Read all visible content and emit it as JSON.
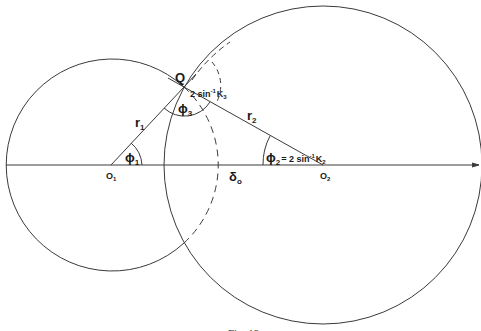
{
  "figure": {
    "caption": "Fig. 13",
    "colors": {
      "line": "#3a3a3a",
      "background": "#ffffff"
    },
    "points": {
      "Q": {
        "label": "Q"
      },
      "O1": {
        "label": "O",
        "sub": "1"
      },
      "O2": {
        "label": "O",
        "sub": "2"
      }
    },
    "segments": {
      "r1": {
        "label": "r",
        "sub": "1"
      },
      "r2": {
        "label": "r",
        "sub": "2"
      },
      "delta0": {
        "label": "δ",
        "sub": "o"
      }
    },
    "angles": {
      "phi1": {
        "label": "ϕ",
        "sub": "1"
      },
      "phi2": {
        "label": "ϕ",
        "sub": "2",
        "eq": "= 2 sin",
        "sup": "-1",
        "k": "K",
        "ksub": "2"
      },
      "phi3": {
        "label": "ϕ",
        "sub": "3"
      },
      "k3": {
        "text": "2 sin",
        "sup": "-1",
        "k": "K",
        "ksub": "3"
      }
    },
    "circles": [
      {
        "name": "circle-O1",
        "center": [
          111,
          165
        ],
        "radius": 106,
        "dashed_inside_other": true
      },
      {
        "name": "circle-O2",
        "center": [
          323,
          165
        ],
        "radius": 159
      }
    ]
  }
}
